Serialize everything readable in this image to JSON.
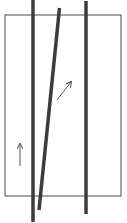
{
  "diagram": {
    "colors": {
      "background": "#ffffff",
      "frame": "#4a4a4a",
      "rod": "#3c3c3c",
      "arrow": "#555555"
    },
    "frame": {
      "x": 5,
      "y": 15,
      "width": 116,
      "height": 181
    },
    "rods": [
      {
        "name": "left-vertical-rod",
        "x1": 33,
        "y1": 0,
        "x2": 33,
        "y2": 222
      },
      {
        "name": "slanted-rod",
        "x1": 59.5,
        "y1": 8,
        "x2": 39,
        "y2": 210
      },
      {
        "name": "right-vertical-rod",
        "x1": 86,
        "y1": 1,
        "x2": 86,
        "y2": 214
      }
    ],
    "arrows": [
      {
        "name": "diagonal-arrow",
        "x1": 57,
        "y1": 100,
        "x2": 71,
        "y2": 82
      },
      {
        "name": "up-arrow",
        "x1": 20,
        "y1": 166,
        "x2": 20,
        "y2": 144
      }
    ]
  }
}
